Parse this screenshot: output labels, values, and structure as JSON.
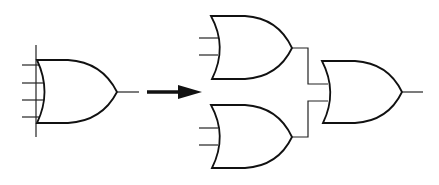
{
  "diagram": {
    "colors": {
      "stroke": "#111111",
      "background": "#ffffff"
    },
    "source_gate": {
      "type": "OR",
      "inputs": 4
    },
    "arrow": {
      "direction": "right"
    },
    "result": {
      "gates": [
        {
          "id": "or-top",
          "type": "OR",
          "inputs": 2
        },
        {
          "id": "or-bottom",
          "type": "OR",
          "inputs": 2
        },
        {
          "id": "or-final",
          "type": "OR",
          "inputs": 2
        }
      ],
      "connections": [
        {
          "from": "or-top",
          "to": "or-final"
        },
        {
          "from": "or-bottom",
          "to": "or-final"
        }
      ]
    }
  }
}
